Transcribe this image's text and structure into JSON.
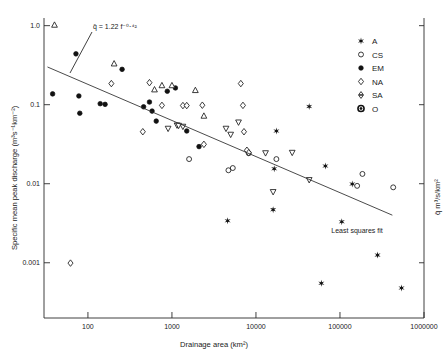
{
  "chart_data": {
    "type": "scatter",
    "title": "",
    "xlabel": "Drainage area (km²)",
    "ylabel": "Specific mean peak discharge  (m³s⁻¹km⁻²)",
    "ylabel_right": "q̄  m³/s/km²",
    "xscale": "log",
    "yscale": "log",
    "xlim": [
      30,
      1000000
    ],
    "ylim": [
      0.0002,
      1.25
    ],
    "grid": false,
    "xticks": [
      100,
      1000,
      10000,
      100000,
      1000000
    ],
    "xticklabels": [
      "100",
      "1000",
      "10000",
      "100000",
      "1000000"
    ],
    "yticks": [
      1.0,
      0.1,
      0.01,
      0.001
    ],
    "yticklabels": [
      "1.0",
      "0.1",
      "0.01",
      "0.001"
    ],
    "legend_position": "upper right",
    "annotations": [
      {
        "name": "fit-equation",
        "text": "q̄ = 1.22 f⁻⁰⋅⁴²"
      },
      {
        "name": "fit-label",
        "text": "Least squares fit"
      }
    ],
    "fit": {
      "label": "Least squares fit",
      "equation": "q̄ = 1.22 f⁻⁰⋅⁴²",
      "coefficient": 1.22,
      "exponent": -0.42,
      "x_start": 33,
      "y_start": 0.3,
      "x_end": 420000,
      "y_end": 0.004
    },
    "series": [
      {
        "name": "A",
        "label": "A",
        "marker": "star",
        "points": [
          [
            4600,
            0.0034
          ],
          [
            16000,
            0.0047
          ],
          [
            16500,
            0.0155
          ],
          [
            17500,
            0.0465
          ],
          [
            43000,
            0.095
          ],
          [
            60000,
            0.00055
          ],
          [
            67000,
            0.0168
          ],
          [
            105000,
            0.0033
          ],
          [
            140000,
            0.0099
          ],
          [
            280000,
            0.00125
          ],
          [
            540000,
            0.00048
          ]
        ]
      },
      {
        "name": "CS",
        "label": "CS",
        "marker": "circle-open",
        "points": [
          [
            1600,
            0.0205
          ],
          [
            4700,
            0.0148
          ],
          [
            5300,
            0.0158
          ],
          [
            8200,
            0.0243
          ],
          [
            17500,
            0.0205
          ],
          [
            160000,
            0.0094
          ],
          [
            185000,
            0.0133
          ],
          [
            430000,
            0.009
          ]
        ]
      },
      {
        "name": "EM",
        "label": "EM",
        "marker": "circle-filled",
        "points": [
          [
            38,
            0.137
          ],
          [
            72,
            0.44
          ],
          [
            78,
            0.129
          ],
          [
            80,
            0.078
          ],
          [
            140,
            0.103
          ],
          [
            160,
            0.101
          ],
          [
            255,
            0.28
          ],
          [
            460,
            0.094
          ],
          [
            540,
            0.108
          ],
          [
            580,
            0.083
          ],
          [
            650,
            0.062
          ],
          [
            880,
            0.148
          ],
          [
            1100,
            0.163
          ],
          [
            1500,
            0.0465
          ],
          [
            2100,
            0.0295
          ]
        ]
      },
      {
        "name": "NA",
        "label": "NA",
        "marker": "diamond-open",
        "points": [
          [
            62,
            0.00099
          ],
          [
            190,
            0.185
          ],
          [
            450,
            0.0455
          ],
          [
            540,
            0.19
          ],
          [
            760,
            0.098
          ],
          [
            1350,
            0.0975
          ],
          [
            1500,
            0.0975
          ],
          [
            2300,
            0.0985
          ],
          [
            2400,
            0.0315
          ],
          [
            6600,
            0.185
          ],
          [
            7000,
            0.098
          ],
          [
            7200,
            0.0455
          ],
          [
            7800,
            0.0265
          ],
          [
            8200,
            0.0247
          ]
        ]
      },
      {
        "name": "SA",
        "label": "SA",
        "marker": "triangle-pair",
        "points": [
          [
            40,
            1.02
          ],
          [
            205,
            0.33
          ],
          [
            620,
            0.155
          ],
          [
            760,
            0.175
          ],
          [
            1000,
            0.175
          ],
          [
            1150,
            0.055
          ],
          [
            1350,
            0.053
          ],
          [
            1900,
            0.152
          ],
          [
            2400,
            0.072
          ],
          [
            4400,
            0.05
          ],
          [
            5000,
            0.042
          ],
          [
            6200,
            0.06
          ],
          [
            13000,
            0.0245
          ],
          [
            27000,
            0.0248
          ],
          [
            43000,
            0.0112
          ],
          [
            900,
            0.05
          ],
          [
            1200,
            0.0545
          ],
          [
            16000,
            0.0079
          ]
        ]
      },
      {
        "name": "O",
        "label": "O",
        "marker": "bullseye",
        "points": []
      }
    ]
  },
  "legend": {
    "items": [
      {
        "label": "A",
        "marker": "star"
      },
      {
        "label": "CS",
        "marker": "circle-open"
      },
      {
        "label": "EM",
        "marker": "circle-filled"
      },
      {
        "label": "NA",
        "marker": "diamond-open"
      },
      {
        "label": "SA",
        "marker": "triangle-pair"
      },
      {
        "label": "O",
        "marker": "bullseye"
      }
    ]
  },
  "axes": {
    "y_title": "Specific mean peak discharge  (m³s⁻¹km⁻²)",
    "x_title": "Drainage area (km²)",
    "y_right_title": "q̄  m³/s/km²"
  }
}
